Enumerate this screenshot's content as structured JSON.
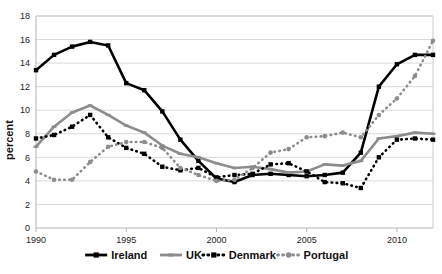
{
  "chart_data": {
    "type": "line",
    "title": "",
    "xlabel": "",
    "ylabel": "percent",
    "xlim": [
      1990,
      2012
    ],
    "ylim": [
      0,
      18
    ],
    "ytick_step": 2,
    "yticks": [
      "0",
      "2",
      "4",
      "6",
      "8",
      "10",
      "12",
      "14",
      "16",
      "18"
    ],
    "xticks": [
      "1990",
      "1995",
      "2000",
      "2005",
      "2010"
    ],
    "xtick_values": [
      1990,
      1995,
      2000,
      2005,
      2010
    ],
    "grid": "horizontal",
    "legend_position": "bottom",
    "x": [
      1990,
      1991,
      1992,
      1993,
      1994,
      1995,
      1996,
      1997,
      1998,
      1999,
      2000,
      2001,
      2002,
      2003,
      2004,
      2005,
      2006,
      2007,
      2008,
      2009,
      2010,
      2011,
      2012
    ],
    "series": [
      {
        "name": "Ireland",
        "color": "#000000",
        "line": "solid",
        "marker": "square",
        "values": [
          13.4,
          14.7,
          15.4,
          15.8,
          15.5,
          12.3,
          11.7,
          9.9,
          7.5,
          5.7,
          4.2,
          3.9,
          4.5,
          4.6,
          4.5,
          4.4,
          4.5,
          4.7,
          6.4,
          12.0,
          13.9,
          14.7,
          14.7
        ]
      },
      {
        "name": "UK",
        "color": "#8c8c8c",
        "line": "solid",
        "marker": "dash",
        "values": [
          6.9,
          8.6,
          9.8,
          10.4,
          9.6,
          8.7,
          8.1,
          7.0,
          6.3,
          6.0,
          5.5,
          5.1,
          5.2,
          5.0,
          4.7,
          4.8,
          5.4,
          5.3,
          5.7,
          7.6,
          7.8,
          8.1,
          8.0
        ]
      },
      {
        "name": "Denmark",
        "color": "#000000",
        "line": "dotted",
        "marker": "square",
        "values": [
          7.6,
          7.9,
          8.6,
          9.6,
          7.7,
          6.8,
          6.3,
          5.2,
          4.9,
          5.1,
          4.3,
          4.5,
          4.6,
          5.4,
          5.5,
          4.8,
          3.9,
          3.8,
          3.4,
          6.0,
          7.5,
          7.6,
          7.5
        ]
      },
      {
        "name": "Portugal",
        "color": "#8c8c8c",
        "line": "dotted",
        "marker": "circle",
        "values": [
          4.8,
          4.1,
          4.1,
          5.6,
          6.9,
          7.3,
          7.3,
          6.8,
          5.1,
          4.5,
          4.0,
          4.1,
          5.1,
          6.4,
          6.7,
          7.7,
          7.8,
          8.1,
          7.7,
          9.6,
          11.0,
          12.9,
          15.9
        ]
      }
    ]
  },
  "legend": {
    "items": [
      {
        "label": "Ireland"
      },
      {
        "label": "UK"
      },
      {
        "label": "Denmark"
      },
      {
        "label": "Portugal"
      }
    ]
  }
}
